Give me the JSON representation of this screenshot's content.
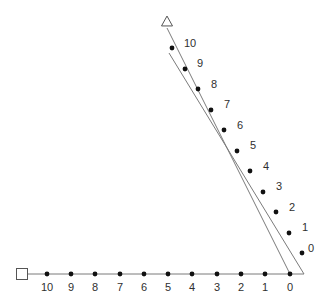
{
  "figure": {
    "background_color": "#ffffff",
    "line_color": "#7b7b7b",
    "dot_color": "#111111",
    "marker_stroke_color": "#555555",
    "marker_fill_color": "#ffffff",
    "label_color": "#2f2f2f",
    "line_width": 1,
    "dot_radius": 2.4,
    "label_font_size": 11
  },
  "markers": {
    "square": {
      "name": "square-marker",
      "shape": "square",
      "filled": false,
      "x": 22,
      "y": 274,
      "size": 11
    },
    "triangle": {
      "name": "triangle-marker",
      "shape": "triangle",
      "filled": false,
      "x": 167,
      "y": 21,
      "size": 11
    }
  },
  "horizontal_axis": {
    "name": "horizontal-number-line",
    "x1": 27,
    "y1": 274,
    "x2": 304,
    "y2": 274,
    "labels": [
      "10",
      "9",
      "8",
      "7",
      "6",
      "5",
      "4",
      "3",
      "2",
      "1",
      "0"
    ],
    "points": [
      {
        "label": "10",
        "x": 47,
        "y": 274,
        "label_x": 47,
        "label_y": 288
      },
      {
        "label": "9",
        "x": 71,
        "y": 274,
        "label_x": 71,
        "label_y": 288
      },
      {
        "label": "8",
        "x": 95,
        "y": 274,
        "label_x": 95,
        "label_y": 288
      },
      {
        "label": "7",
        "x": 120,
        "y": 274,
        "label_x": 120,
        "label_y": 288
      },
      {
        "label": "6",
        "x": 144,
        "y": 274,
        "label_x": 144,
        "label_y": 288
      },
      {
        "label": "5",
        "x": 168,
        "y": 274,
        "label_x": 168,
        "label_y": 288
      },
      {
        "label": "4",
        "x": 192,
        "y": 274,
        "label_x": 192,
        "label_y": 288
      },
      {
        "label": "3",
        "x": 217,
        "y": 274,
        "label_x": 217,
        "label_y": 288
      },
      {
        "label": "2",
        "x": 241,
        "y": 274,
        "label_x": 241,
        "label_y": 288
      },
      {
        "label": "1",
        "x": 265,
        "y": 274,
        "label_x": 265,
        "label_y": 288
      },
      {
        "label": "0",
        "x": 290,
        "y": 274,
        "label_x": 290,
        "label_y": 288
      }
    ]
  },
  "left_ray": {
    "name": "left-ray-line",
    "description": "Line from triangle apex to the zero tick of the horizontal axis",
    "x1": 167,
    "y1": 28,
    "x2": 290,
    "y2": 274
  },
  "right_ray": {
    "name": "right-ray-line",
    "description": "Line carrying the labelled dots, from near the apex to the right end of the axis",
    "x1": 169,
    "y1": 53,
    "x2": 304,
    "y2": 274,
    "labels": [
      "10",
      "9",
      "8",
      "7",
      "6",
      "5",
      "4",
      "3",
      "2",
      "1",
      "0"
    ],
    "points": [
      {
        "label": "10",
        "x": 172,
        "y": 48,
        "label_x": 184,
        "label_y": 44
      },
      {
        "label": "9",
        "x": 185,
        "y": 69,
        "label_x": 197,
        "label_y": 64
      },
      {
        "label": "8",
        "x": 198,
        "y": 89,
        "label_x": 211,
        "label_y": 85
      },
      {
        "label": "7",
        "x": 211,
        "y": 110,
        "label_x": 224,
        "label_y": 105
      },
      {
        "label": "6",
        "x": 224,
        "y": 130,
        "label_x": 237,
        "label_y": 126
      },
      {
        "label": "5",
        "x": 237,
        "y": 151,
        "label_x": 250,
        "label_y": 146
      },
      {
        "label": "4",
        "x": 250,
        "y": 171,
        "label_x": 263,
        "label_y": 167
      },
      {
        "label": "3",
        "x": 263,
        "y": 192,
        "label_x": 276,
        "label_y": 187
      },
      {
        "label": "2",
        "x": 276,
        "y": 212,
        "label_x": 289,
        "label_y": 208
      },
      {
        "label": "1",
        "x": 289,
        "y": 233,
        "label_x": 302,
        "label_y": 228
      },
      {
        "label": "0",
        "x": 302,
        "y": 253,
        "label_x": 308,
        "label_y": 249
      }
    ]
  }
}
